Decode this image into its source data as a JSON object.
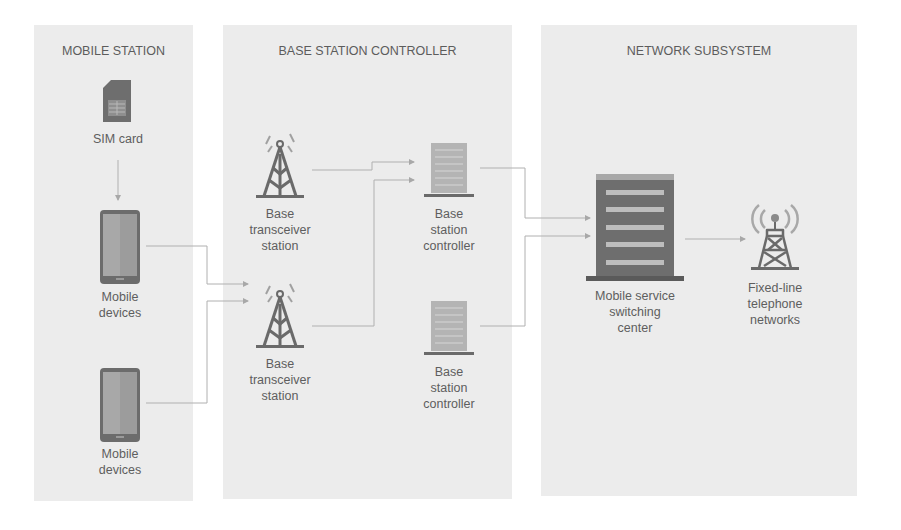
{
  "colors": {
    "panel_bg": "#ececec",
    "icon_dark": "#6a6a6a",
    "icon_mid": "#9a9a9a",
    "icon_light": "#bdbdbd",
    "connector": "#a8a8a8"
  },
  "panels": [
    {
      "id": "mobile-station",
      "title": "MOBILE STATION"
    },
    {
      "id": "base-station-controller",
      "title": "BASE STATION CONTROLLER"
    },
    {
      "id": "network-subsystem",
      "title": "NETWORK SUBSYSTEM"
    }
  ],
  "nodes": {
    "sim_card": {
      "icon": "sim-card-icon",
      "label": "SIM card"
    },
    "mobile_1": {
      "icon": "smartphone-icon",
      "label_line1": "Mobile",
      "label_line2": "devices"
    },
    "mobile_2": {
      "icon": "smartphone-icon",
      "label_line1": "Mobile",
      "label_line2": "devices"
    },
    "bts_1": {
      "icon": "cell-tower-icon",
      "label_line1": "Base",
      "label_line2": "transceiver",
      "label_line3": "station"
    },
    "bts_2": {
      "icon": "cell-tower-icon",
      "label_line1": "Base",
      "label_line2": "transceiver",
      "label_line3": "station"
    },
    "bsc_1": {
      "icon": "server-icon",
      "label_line1": "Base",
      "label_line2": "station",
      "label_line3": "controller"
    },
    "bsc_2": {
      "icon": "server-icon",
      "label_line1": "Base",
      "label_line2": "station",
      "label_line3": "controller"
    },
    "msc": {
      "icon": "building-icon",
      "label_line1": "Mobile service",
      "label_line2": "switching",
      "label_line3": "center"
    },
    "fixed_line": {
      "icon": "radio-tower-icon",
      "label_line1": "Fixed-line",
      "label_line2": "telephone",
      "label_line3": "networks"
    }
  },
  "connections": [
    {
      "from": "SIM card",
      "to": "Mobile devices (1)"
    },
    {
      "from": "Mobile devices (1)",
      "to": "Base transceiver station (2)"
    },
    {
      "from": "Mobile devices (2)",
      "to": "Base transceiver station (2)"
    },
    {
      "from": "Base transceiver station (1)",
      "to": "Base station controller (1)"
    },
    {
      "from": "Base transceiver station (2)",
      "to": "Base station controller (1)"
    },
    {
      "from": "Base station controller (1)",
      "to": "Mobile service switching center"
    },
    {
      "from": "Base station controller (2)",
      "to": "Mobile service switching center"
    },
    {
      "from": "Mobile service switching center",
      "to": "Fixed-line telephone networks"
    }
  ]
}
